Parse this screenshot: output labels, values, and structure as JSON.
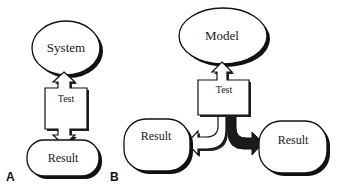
{
  "panels": [
    {
      "id": "A",
      "label": "A",
      "nodes": {
        "top": "System",
        "middle": "Test",
        "bottom": "Result"
      },
      "edges": [
        {
          "from": "Test",
          "to": "System",
          "style": "white-arrow"
        },
        {
          "from": "Test",
          "to": "Result",
          "style": "white-arrow"
        }
      ]
    },
    {
      "id": "B",
      "label": "B",
      "nodes": {
        "top": "Model",
        "middle": "Test",
        "left": "Result",
        "right": "Result"
      },
      "edges": [
        {
          "from": "Test",
          "to": "Model",
          "style": "white-arrow"
        },
        {
          "from": "Test",
          "to": "Result (left)",
          "style": "white-curved-arrow"
        },
        {
          "from": "Test",
          "to": "Result (right)",
          "style": "black-curved-arrow"
        }
      ]
    }
  ],
  "colors": {
    "stroke": "#111111",
    "fill": "#ffffff",
    "shadow": "#111111",
    "dark_arrow": "#1a1a1a"
  }
}
